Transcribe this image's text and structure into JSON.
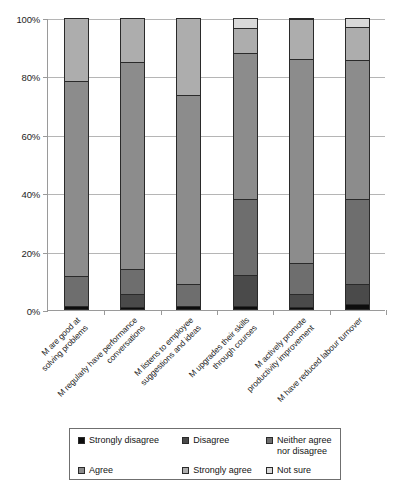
{
  "chart_data": {
    "type": "bar",
    "subtype": "stacked-percentage",
    "title": "",
    "xlabel": "",
    "ylabel": "",
    "ylim": [
      0,
      100
    ],
    "ytick_labels": [
      "0%",
      "20%",
      "40%",
      "60%",
      "80%",
      "100%"
    ],
    "ytick_values": [
      0,
      20,
      40,
      60,
      80,
      100
    ],
    "grid": true,
    "legend_position": "bottom",
    "categories": [
      "M are good at\nsolving problems",
      "M regularly have performance\nconversations",
      "M listens to employee\nsuggestions and ideas",
      "M upgrades their skills\nthrough courses",
      "M actively promote\nproductivity improvement",
      "M have reduced labour turnover"
    ],
    "series": [
      {
        "name": "Strongly disagree",
        "color": "#0d0d0d",
        "values": [
          1.5,
          1.0,
          1.5,
          1.5,
          1.0,
          2.0
        ]
      },
      {
        "name": "Disagree",
        "color": "#4a4a4a",
        "values": [
          0.0,
          4.5,
          0.0,
          10.5,
          4.5,
          7.0
        ]
      },
      {
        "name": "Neither agree nor disagree",
        "color": "#6e6e6e",
        "values": [
          10.0,
          8.5,
          7.5,
          26.0,
          10.5,
          29.0
        ]
      },
      {
        "name": "Agree",
        "color": "#8c8c8c",
        "values": [
          67.0,
          71.0,
          64.5,
          50.0,
          70.0,
          47.5
        ]
      },
      {
        "name": "Strongly agree",
        "color": "#adadad",
        "values": [
          21.5,
          15.0,
          26.5,
          8.5,
          13.5,
          11.5
        ]
      },
      {
        "name": "Not sure",
        "color": "#d9d9d9",
        "values": [
          0.0,
          0.0,
          0.0,
          3.5,
          0.5,
          3.0
        ]
      }
    ]
  },
  "legend": {
    "items": [
      {
        "label": "Strongly disagree",
        "color": "#0d0d0d"
      },
      {
        "label": "Disagree",
        "color": "#4a4a4a"
      },
      {
        "label": "Neither agree\nnor disagree",
        "color": "#6e6e6e"
      },
      {
        "label": "Agree",
        "color": "#8c8c8c"
      },
      {
        "label": "Strongly agree",
        "color": "#adadad"
      },
      {
        "label": "Not sure",
        "color": "#d9d9d9"
      }
    ]
  },
  "axis": {
    "y_labels": [
      "100%",
      "80%",
      "60%",
      "40%",
      "20%",
      "0%"
    ]
  }
}
